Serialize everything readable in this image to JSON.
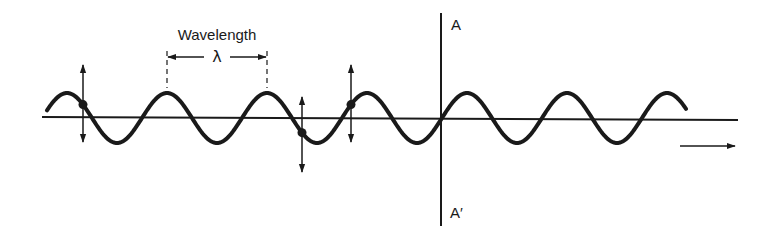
{
  "diagram": {
    "type": "transverse-wave",
    "wavelength_label": "Wavelength",
    "wavelength_symbol": "λ",
    "plane_top_label": "A",
    "plane_bottom_label": "A′",
    "colors": {
      "ink": "#1a1a1a",
      "background": "#ffffff"
    },
    "geometry": {
      "axis_y": 118,
      "axis_x_start": 42,
      "axis_x_end": 738,
      "wave_x_start": 47,
      "wave_x_end": 686,
      "wave_period": 100,
      "wave_amplitude": 25,
      "first_crest_x": 167,
      "plane_x": 441,
      "plane_y_top": 13,
      "plane_y_bottom": 226,
      "wavelength_marker_x": [
        167,
        267
      ],
      "propagation_arrow": {
        "x1": 680,
        "x2": 735,
        "y": 146
      },
      "oscillation_markers": [
        {
          "x": 83,
          "y_top": 65,
          "y_bottom": 142
        },
        {
          "x": 302,
          "y_top": 97,
          "y_bottom": 172
        },
        {
          "x": 351,
          "y_top": 65,
          "y_bottom": 142
        }
      ]
    },
    "icons": {
      "propagation": "right-arrow-icon",
      "oscillation": "double-vertical-arrow-icon",
      "particle": "dot-icon"
    }
  }
}
